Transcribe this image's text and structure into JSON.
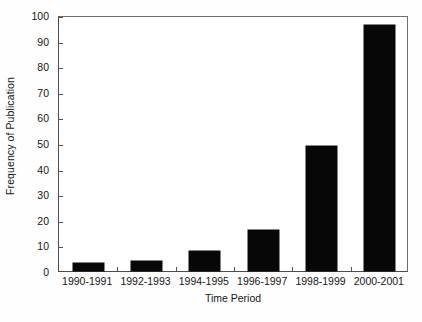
{
  "chart_data": {
    "type": "bar",
    "title": "",
    "xlabel": "Time Period",
    "ylabel": "Frequency of Publication",
    "categories": [
      "1990-1991",
      "1992-1993",
      "1994-1995",
      "1996-1997",
      "1998-1999",
      "2000-2001"
    ],
    "values": [
      3,
      4,
      8,
      16,
      49,
      96
    ],
    "ylim": [
      0,
      100
    ],
    "yticks": [
      0,
      10,
      20,
      30,
      40,
      50,
      60,
      70,
      80,
      90,
      100
    ],
    "ytick_labels": [
      "0",
      "10",
      "20",
      "30",
      "40",
      "50",
      "60",
      "70",
      "80",
      "90",
      "100"
    ],
    "grid": false,
    "legend": null,
    "bar_color": "#070707",
    "axis_color": "#4c4c4c",
    "background_color": "#ffffff",
    "series": [
      {
        "name": "Frequency of Publication",
        "values": [
          3,
          4,
          8,
          16,
          49,
          96
        ]
      }
    ]
  }
}
